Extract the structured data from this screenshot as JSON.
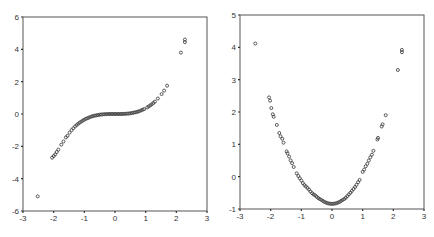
{
  "chart_data": [
    {
      "type": "scatter",
      "title": "",
      "xlabel": "",
      "ylabel": "",
      "xlim": [
        -3,
        3
      ],
      "ylim": [
        -6,
        6
      ],
      "x_ticks": [
        -3,
        -2,
        -1,
        0,
        1,
        2,
        3
      ],
      "y_ticks": [
        -6,
        -4,
        -2,
        0,
        2,
        4,
        6
      ],
      "grid": false,
      "legend": null,
      "box": [
        23,
        17,
        207,
        211
      ],
      "description": "Cubic-shaped relationship, approx y = 0.35*x^3",
      "points": [
        [
          -2.52,
          -5.1
        ],
        [
          -2.05,
          -2.7
        ],
        [
          -2.0,
          -2.6
        ],
        [
          -1.95,
          -2.5
        ],
        [
          -1.9,
          -2.35
        ],
        [
          -1.85,
          -2.2
        ],
        [
          -1.75,
          -1.9
        ],
        [
          -1.68,
          -1.7
        ],
        [
          -1.6,
          -1.45
        ],
        [
          -1.55,
          -1.35
        ],
        [
          -1.48,
          -1.15
        ],
        [
          -1.42,
          -1.0
        ],
        [
          -1.36,
          -0.88
        ],
        [
          -1.3,
          -0.77
        ],
        [
          -1.25,
          -0.68
        ],
        [
          -1.2,
          -0.6
        ],
        [
          -1.15,
          -0.53
        ],
        [
          -1.1,
          -0.47
        ],
        [
          -1.05,
          -0.41
        ],
        [
          -1.0,
          -0.35
        ],
        [
          -0.95,
          -0.3
        ],
        [
          -0.9,
          -0.26
        ],
        [
          -0.85,
          -0.22
        ],
        [
          -0.8,
          -0.18
        ],
        [
          -0.75,
          -0.15
        ],
        [
          -0.7,
          -0.12
        ],
        [
          -0.65,
          -0.1
        ],
        [
          -0.6,
          -0.08
        ],
        [
          -0.55,
          -0.06
        ],
        [
          -0.5,
          -0.045
        ],
        [
          -0.45,
          -0.03
        ],
        [
          -0.4,
          -0.022
        ],
        [
          -0.35,
          -0.015
        ],
        [
          -0.3,
          -0.01
        ],
        [
          -0.25,
          -0.005
        ],
        [
          -0.2,
          -0.003
        ],
        [
          -0.15,
          -0.001
        ],
        [
          -0.1,
          0
        ],
        [
          -0.05,
          0
        ],
        [
          0,
          0
        ],
        [
          0.05,
          0
        ],
        [
          0.1,
          0
        ],
        [
          0.15,
          0.001
        ],
        [
          0.2,
          0.003
        ],
        [
          0.25,
          0.005
        ],
        [
          0.3,
          0.01
        ],
        [
          0.35,
          0.015
        ],
        [
          0.4,
          0.022
        ],
        [
          0.45,
          0.03
        ],
        [
          0.5,
          0.045
        ],
        [
          0.55,
          0.06
        ],
        [
          0.6,
          0.08
        ],
        [
          0.65,
          0.1
        ],
        [
          0.7,
          0.12
        ],
        [
          0.75,
          0.15
        ],
        [
          0.8,
          0.18
        ],
        [
          0.85,
          0.22
        ],
        [
          0.9,
          0.26
        ],
        [
          0.95,
          0.3
        ],
        [
          1.05,
          0.41
        ],
        [
          1.1,
          0.47
        ],
        [
          1.15,
          0.53
        ],
        [
          1.2,
          0.6
        ],
        [
          1.25,
          0.68
        ],
        [
          1.3,
          0.77
        ],
        [
          1.4,
          0.96
        ],
        [
          1.52,
          1.23
        ],
        [
          1.6,
          1.45
        ],
        [
          1.7,
          1.75
        ],
        [
          2.15,
          3.8
        ],
        [
          2.28,
          4.45
        ],
        [
          2.28,
          4.6
        ]
      ]
    },
    {
      "type": "scatter",
      "title": "",
      "xlabel": "",
      "ylabel": "",
      "xlim": [
        -3,
        3
      ],
      "ylim": [
        -1,
        5
      ],
      "x_ticks": [
        -3,
        -2,
        -1,
        0,
        1,
        2,
        3
      ],
      "y_ticks": [
        -1,
        0,
        1,
        2,
        3,
        4,
        5
      ],
      "grid": false,
      "legend": null,
      "box": [
        240,
        15,
        424,
        209
      ],
      "description": "Parabolic relationship, approx y = x^2 - 0.85",
      "points": [
        [
          -2.5,
          4.12
        ],
        [
          -2.05,
          2.45
        ],
        [
          -2.02,
          2.35
        ],
        [
          -1.98,
          2.12
        ],
        [
          -1.93,
          1.93
        ],
        [
          -1.9,
          1.85
        ],
        [
          -1.8,
          1.6
        ],
        [
          -1.72,
          1.35
        ],
        [
          -1.68,
          1.25
        ],
        [
          -1.62,
          1.17
        ],
        [
          -1.58,
          1.05
        ],
        [
          -1.48,
          0.78
        ],
        [
          -1.45,
          0.72
        ],
        [
          -1.4,
          0.62
        ],
        [
          -1.35,
          0.5
        ],
        [
          -1.3,
          0.42
        ],
        [
          -1.25,
          0.3
        ],
        [
          -1.15,
          0.1
        ],
        [
          -1.1,
          0.02
        ],
        [
          -1.05,
          -0.05
        ],
        [
          -1.0,
          -0.12
        ],
        [
          -0.95,
          -0.2
        ],
        [
          -0.9,
          -0.26
        ],
        [
          -0.85,
          -0.3
        ],
        [
          -0.8,
          -0.35
        ],
        [
          -0.75,
          -0.4
        ],
        [
          -0.7,
          -0.46
        ],
        [
          -0.65,
          -0.51
        ],
        [
          -0.6,
          -0.55
        ],
        [
          -0.55,
          -0.58
        ],
        [
          -0.5,
          -0.62
        ],
        [
          -0.45,
          -0.66
        ],
        [
          -0.4,
          -0.69
        ],
        [
          -0.35,
          -0.72
        ],
        [
          -0.3,
          -0.75
        ],
        [
          -0.25,
          -0.78
        ],
        [
          -0.2,
          -0.8
        ],
        [
          -0.15,
          -0.82
        ],
        [
          -0.1,
          -0.83
        ],
        [
          -0.05,
          -0.84
        ],
        [
          0,
          -0.84
        ],
        [
          0.05,
          -0.84
        ],
        [
          0.1,
          -0.83
        ],
        [
          0.15,
          -0.82
        ],
        [
          0.2,
          -0.8
        ],
        [
          0.25,
          -0.78
        ],
        [
          0.3,
          -0.75
        ],
        [
          0.35,
          -0.72
        ],
        [
          0.4,
          -0.69
        ],
        [
          0.45,
          -0.65
        ],
        [
          0.5,
          -0.6
        ],
        [
          0.55,
          -0.55
        ],
        [
          0.6,
          -0.5
        ],
        [
          0.65,
          -0.44
        ],
        [
          0.7,
          -0.38
        ],
        [
          0.75,
          -0.32
        ],
        [
          0.8,
          -0.25
        ],
        [
          0.85,
          -0.17
        ],
        [
          0.9,
          -0.1
        ],
        [
          1.0,
          0.15
        ],
        [
          1.05,
          0.22
        ],
        [
          1.1,
          0.32
        ],
        [
          1.15,
          0.4
        ],
        [
          1.2,
          0.5
        ],
        [
          1.25,
          0.6
        ],
        [
          1.3,
          0.68
        ],
        [
          1.35,
          0.8
        ],
        [
          1.48,
          1.15
        ],
        [
          1.5,
          1.2
        ],
        [
          1.62,
          1.55
        ],
        [
          1.65,
          1.62
        ],
        [
          1.75,
          1.9
        ],
        [
          2.15,
          3.3
        ],
        [
          2.28,
          3.85
        ],
        [
          2.28,
          3.92
        ]
      ]
    }
  ],
  "charts": [
    {
      "x_tick_labels": [
        "-3",
        "-2",
        "-1",
        "0",
        "1",
        "2",
        "3"
      ],
      "y_tick_labels": [
        "6",
        "4",
        "2",
        "0",
        "-2",
        "-4",
        "-6"
      ]
    },
    {
      "x_tick_labels": [
        "-3",
        "-2",
        "-1",
        "0",
        "1",
        "2",
        "3"
      ],
      "y_tick_labels": [
        "5",
        "4",
        "3",
        "2",
        "1",
        "0",
        "-1"
      ]
    }
  ]
}
